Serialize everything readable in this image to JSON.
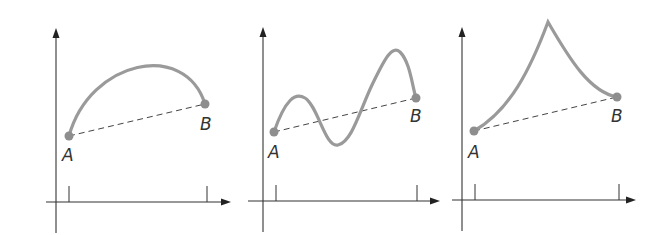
{
  "figure": {
    "colors": {
      "axis": "#333333",
      "curve": "#9a9a9a",
      "chord": "#444444",
      "endpoint": "#8e8e8e",
      "label": "#333333"
    },
    "panels": [
      {
        "id": "panel-1",
        "curve_type": "smooth concave arc",
        "points": {
          "A": {
            "label": "A",
            "x": 69,
            "y": 136
          },
          "B": {
            "label": "B",
            "x": 205,
            "y": 104
          }
        },
        "axes": {
          "origin": [
            56,
            202
          ],
          "x_end": 230,
          "y_top": 29,
          "y_bottom": 233,
          "x_start": 46
        },
        "ticks": [
          69,
          207
        ],
        "curve_path": "M69,136 C90,60 185,40 205,104",
        "label_positions": {
          "A": [
            62,
            161
          ],
          "B": [
            200,
            130
          ]
        }
      },
      {
        "id": "panel-2",
        "curve_type": "oscillating wave crossing chord",
        "points": {
          "A": {
            "label": "A",
            "x": 274,
            "y": 132
          },
          "B": {
            "label": "B",
            "x": 416,
            "y": 98
          }
        },
        "axes": {
          "origin": [
            263,
            201
          ],
          "x_end": 439,
          "y_top": 28,
          "y_bottom": 232,
          "x_start": 248
        },
        "ticks": [
          276,
          417
        ],
        "curve_path": "M274,132 C285,100 295,92 305,98 C318,106 325,148 338,145 C352,142 360,110 372,85 C385,58 392,45 400,52 C410,62 412,85 416,98",
        "label_positions": {
          "A": [
            268,
            158
          ],
          "B": [
            408,
            122
          ]
        }
      },
      {
        "id": "panel-3",
        "curve_type": "cusp peak",
        "points": {
          "A": {
            "label": "A",
            "x": 474,
            "y": 131
          },
          "B": {
            "label": "B",
            "x": 617,
            "y": 97
          }
        },
        "axes": {
          "origin": [
            462,
            200
          ],
          "x_end": 635,
          "y_top": 28,
          "y_bottom": 231,
          "x_start": 452
        },
        "ticks": [
          475,
          619
        ],
        "curve_path": "M474,131 C510,110 530,70 548,22 C570,60 590,92 617,97",
        "label_positions": {
          "A": [
            468,
            158
          ],
          "B": [
            610,
            122
          ]
        }
      }
    ]
  }
}
